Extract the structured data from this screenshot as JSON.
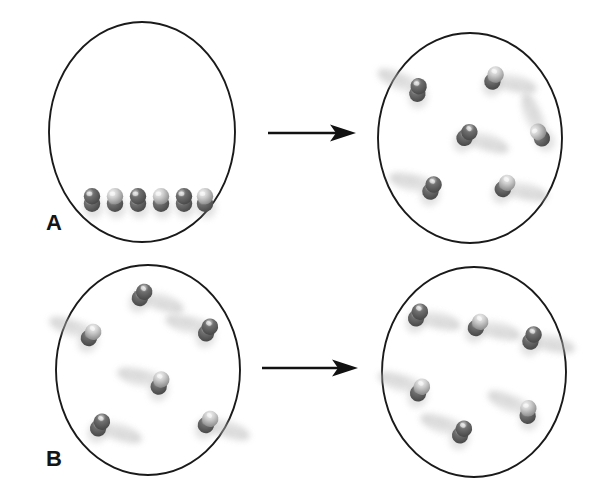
{
  "figure": {
    "background_color": "#ffffff",
    "width": 608,
    "height": 491,
    "outline_color": "#1a1a1a",
    "molecule_dark": "#4a4a4a",
    "molecule_mid": "#6f6f6f",
    "molecule_light": "#cfcfcf",
    "blur_color": "#b9b9b9",
    "arrow_color": "#111111"
  },
  "panels": [
    {
      "id": "panel-a",
      "label": "A",
      "label_x": 46,
      "label_y": 212,
      "arrow": {
        "x1": 268,
        "y1": 133,
        "x2": 356,
        "y2": 133
      },
      "vessels": [
        {
          "id": "panel-a-before",
          "state": "condensed-row",
          "cx": 142,
          "cy": 132,
          "rx": 93,
          "ry": 110,
          "molecule_count": 6,
          "molecules": [
            {
              "x": 92,
              "y": 200,
              "angle": 90,
              "blur": 0
            },
            {
              "x": 115,
              "y": 200,
              "angle": 90,
              "blur": 0
            },
            {
              "x": 138,
              "y": 200,
              "angle": 90,
              "blur": 0
            },
            {
              "x": 161,
              "y": 200,
              "angle": 90,
              "blur": 0
            },
            {
              "x": 184,
              "y": 200,
              "angle": 90,
              "blur": 0
            },
            {
              "x": 205,
              "y": 200,
              "angle": 90,
              "blur": 0
            }
          ]
        },
        {
          "id": "panel-a-after",
          "state": "dispersed-gas",
          "cx": 470,
          "cy": 138,
          "rx": 92,
          "ry": 105,
          "molecule_count": 6,
          "molecules": [
            {
              "x": 418,
              "y": 90,
              "angle": 100,
              "blur": 1,
              "blur_angle": 205
            },
            {
              "x": 494,
              "y": 78,
              "angle": 115,
              "blur": 1,
              "blur_angle": 15
            },
            {
              "x": 467,
              "y": 135,
              "angle": 130,
              "blur": 1,
              "blur_angle": 20
            },
            {
              "x": 540,
              "y": 135,
              "angle": 60,
              "blur": 1,
              "blur_angle": 250
            },
            {
              "x": 432,
              "y": 188,
              "angle": 115,
              "blur": 1,
              "blur_angle": 195
            },
            {
              "x": 505,
              "y": 186,
              "angle": 125,
              "blur": 1,
              "blur_angle": 15
            }
          ]
        }
      ]
    },
    {
      "id": "panel-b",
      "label": "B",
      "label_x": 46,
      "label_y": 448,
      "arrow": {
        "x1": 262,
        "y1": 368,
        "x2": 358,
        "y2": 368
      },
      "vessels": [
        {
          "id": "panel-b-before",
          "state": "dispersed-gas",
          "cx": 148,
          "cy": 370,
          "rx": 92,
          "ry": 105,
          "molecule_count": 6,
          "molecules": [
            {
              "x": 142,
              "y": 295,
              "angle": 125,
              "blur": 1,
              "blur_angle": 20
            },
            {
              "x": 91,
              "y": 335,
              "angle": 125,
              "blur": 1,
              "blur_angle": 200
            },
            {
              "x": 208,
              "y": 330,
              "angle": 120,
              "blur": 1,
              "blur_angle": 195
            },
            {
              "x": 160,
              "y": 383,
              "angle": 110,
              "blur": 1,
              "blur_angle": 195
            },
            {
              "x": 100,
              "y": 425,
              "angle": 120,
              "blur": 1,
              "blur_angle": 20
            },
            {
              "x": 208,
              "y": 422,
              "angle": 125,
              "blur": 1,
              "blur_angle": 20
            }
          ]
        },
        {
          "id": "panel-b-after",
          "state": "dispersed-gas",
          "cx": 474,
          "cy": 372,
          "rx": 92,
          "ry": 105,
          "molecule_count": 6,
          "molecules": [
            {
              "x": 418,
              "y": 315,
              "angle": 120,
              "blur": 1,
              "blur_angle": 15
            },
            {
              "x": 478,
              "y": 325,
              "angle": 125,
              "blur": 1,
              "blur_angle": 15
            },
            {
              "x": 532,
              "y": 338,
              "angle": 115,
              "blur": 1,
              "blur_angle": 15
            },
            {
              "x": 420,
              "y": 390,
              "angle": 120,
              "blur": 1,
              "blur_angle": 200
            },
            {
              "x": 462,
              "y": 432,
              "angle": 120,
              "blur": 1,
              "blur_angle": 200
            },
            {
              "x": 528,
              "y": 412,
              "angle": 95,
              "blur": 1,
              "blur_angle": 205
            }
          ]
        }
      ]
    }
  ]
}
